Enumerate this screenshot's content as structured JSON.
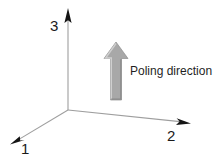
{
  "figure": {
    "type": "axis-diagram",
    "background_color": "#ffffff",
    "width": 214,
    "height": 161
  },
  "axes": {
    "origin": {
      "x": 68,
      "y": 110
    },
    "line_color": "#9a9a9a",
    "arrowhead_color": "#111111",
    "items": [
      {
        "id": "axis-3",
        "label": "3",
        "direction": "up",
        "start": {
          "x": 68,
          "y": 110
        },
        "end": {
          "x": 68,
          "y": 9
        },
        "label_pos": {
          "x": 50,
          "y": 18
        }
      },
      {
        "id": "axis-2",
        "label": "2",
        "direction": "down-right",
        "start": {
          "x": 68,
          "y": 110
        },
        "end": {
          "x": 190,
          "y": 123
        },
        "label_pos": {
          "x": 167,
          "y": 128
        }
      },
      {
        "id": "axis-1",
        "label": "1",
        "direction": "down-left",
        "start": {
          "x": 68,
          "y": 110
        },
        "end": {
          "x": 11,
          "y": 144
        },
        "label_pos": {
          "x": 21,
          "y": 141
        }
      }
    ]
  },
  "poling_arrow": {
    "caption": "Poling direction",
    "direction": "up",
    "fill_color": "#a8a8a8",
    "edge_light_color": "#c9c9c9",
    "edge_dark_color": "#8d8d8d",
    "tip": {
      "x": 116,
      "y": 42
    },
    "tail": {
      "x": 116,
      "y": 100
    },
    "head_width": 24,
    "shaft_width": 11,
    "caption_pos": {
      "x": 130,
      "y": 65
    }
  }
}
